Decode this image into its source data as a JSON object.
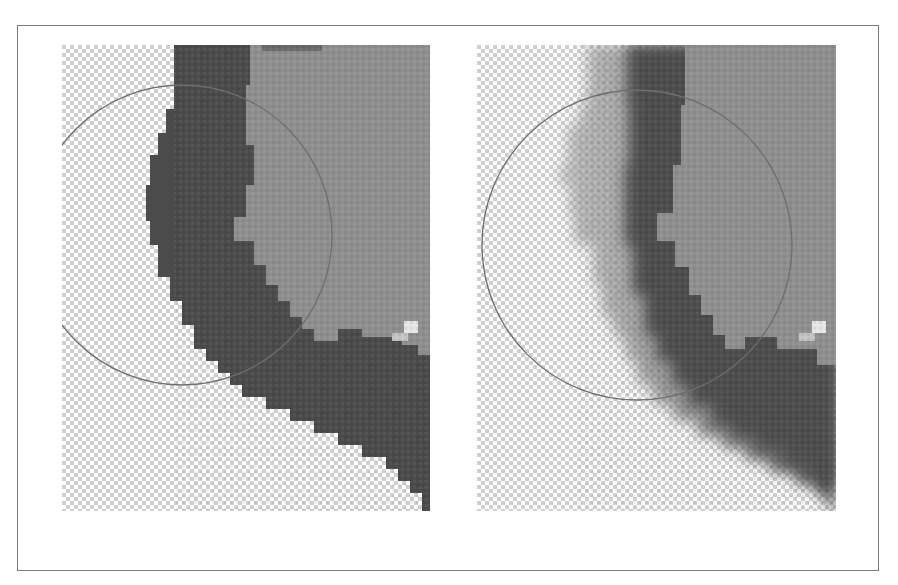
{
  "figure": {
    "colors": {
      "frame_border": "#7a7a7a",
      "checker_light": "#ffffff",
      "checker_dark": "#cccccc",
      "dark_region": "#4a4a4a",
      "mid_region": "#8e8e8e",
      "circle_stroke": "#6e6e6e",
      "highlight": "#e8e8e8"
    },
    "panels": [
      {
        "id": "left",
        "edge_style": "hard-edged selection",
        "circle": {
          "cx": 120,
          "cy": 190,
          "r": 150
        }
      },
      {
        "id": "right",
        "edge_style": "feathered / soft-edged selection",
        "circle": {
          "cx": 160,
          "cy": 200,
          "r": 155
        }
      }
    ],
    "caption": ""
  }
}
